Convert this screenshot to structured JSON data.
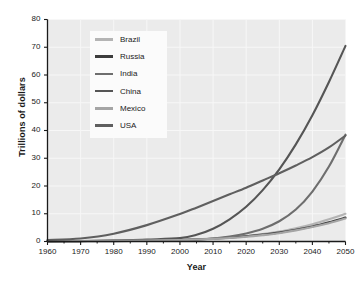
{
  "chart_data": {
    "type": "line",
    "title": "",
    "xlabel": "Year",
    "ylabel": "Trillions of dollars",
    "xlim": [
      1960,
      2050
    ],
    "ylim": [
      0,
      80
    ],
    "xticks": [
      1960,
      1970,
      1980,
      1990,
      2000,
      2010,
      2020,
      2030,
      2040,
      2050
    ],
    "yticks": [
      0,
      10,
      20,
      30,
      40,
      50,
      60,
      70,
      80
    ],
    "grid": true,
    "legend_position": "upper-left-inside",
    "x": [
      1960,
      1970,
      1980,
      1990,
      2000,
      2005,
      2010,
      2015,
      2020,
      2025,
      2030,
      2035,
      2040,
      2045,
      2050
    ],
    "series": [
      {
        "name": "Brazil",
        "color": "#b4b4b4",
        "values": [
          0.1,
          0.2,
          0.3,
          0.4,
          0.6,
          0.8,
          1.1,
          1.5,
          2.0,
          2.7,
          3.6,
          4.8,
          6.2,
          8.0,
          10.0
        ]
      },
      {
        "name": "Russia",
        "color": "#3c3c3c",
        "values": [
          0.1,
          0.15,
          0.25,
          0.35,
          0.5,
          0.7,
          1.0,
          1.4,
          1.9,
          2.5,
          3.2,
          4.2,
          5.4,
          6.9,
          8.6
        ]
      },
      {
        "name": "India",
        "color": "#6e6e6e",
        "values": [
          0.05,
          0.1,
          0.15,
          0.25,
          0.45,
          0.7,
          1.1,
          1.8,
          2.9,
          4.6,
          7.3,
          11.5,
          18.0,
          27.0,
          38.5
        ]
      },
      {
        "name": "China",
        "color": "#555555",
        "values": [
          0.05,
          0.15,
          0.3,
          0.7,
          1.2,
          2.4,
          4.6,
          8.0,
          12.5,
          18.5,
          26.0,
          35.0,
          45.5,
          57.5,
          70.5
        ]
      },
      {
        "name": "Mexico",
        "color": "#a5a5a5",
        "values": [
          0.1,
          0.18,
          0.28,
          0.38,
          0.55,
          0.72,
          0.95,
          1.25,
          1.7,
          2.3,
          3.0,
          4.0,
          5.2,
          6.6,
          8.3
        ]
      },
      {
        "name": "USA",
        "color": "#5f5f5f",
        "values": [
          0.55,
          1.1,
          2.8,
          5.9,
          9.9,
          12.2,
          14.6,
          17.0,
          19.4,
          22.0,
          24.6,
          27.4,
          30.4,
          33.9,
          38.2
        ]
      }
    ],
    "colors": {
      "plot_background": "#ebebeb",
      "grid_line": "#f7f7f7",
      "axis_line": "#1a1a1a",
      "text": "#1a1a1a",
      "legend_background": "#fbfbfb"
    }
  }
}
